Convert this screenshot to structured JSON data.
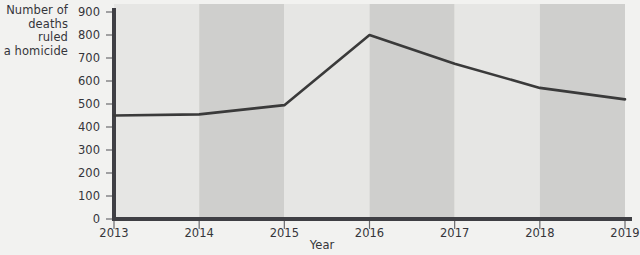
{
  "chart_data": {
    "type": "line",
    "title": "",
    "xlabel": "Year",
    "ylabel": "Number of deaths ruled a homicide",
    "ylabel_lines": [
      "Number of",
      "deaths ruled",
      "a homicide"
    ],
    "categories": [
      "2013",
      "2014",
      "2015",
      "2016",
      "2017",
      "2018",
      "2019"
    ],
    "x": [
      2013,
      2014,
      2015,
      2016,
      2017,
      2018,
      2019
    ],
    "values": [
      450,
      455,
      495,
      800,
      675,
      570,
      520
    ],
    "series": [
      {
        "name": "Number of deaths ruled a homicide",
        "values": [
          450,
          455,
          495,
          800,
          675,
          570,
          520
        ]
      }
    ],
    "ylim": [
      0,
      900
    ],
    "xlim": [
      2013,
      2019
    ],
    "ytick_labels": [
      "0",
      "100",
      "200",
      "300",
      "400",
      "500",
      "600",
      "700",
      "800",
      "900"
    ],
    "ytick_values": [
      0,
      100,
      200,
      300,
      400,
      500,
      600,
      700,
      800,
      900
    ],
    "grid": false,
    "legend": "none",
    "band_shading": "alternating vertical bands per year interval",
    "colors": {
      "line": "#3a3a3a",
      "axis": "#3f3f44",
      "band_light": "#e6e6e4",
      "band_dark": "#cfcfcd",
      "background": "#f2f2f0",
      "text": "#35353a"
    }
  }
}
